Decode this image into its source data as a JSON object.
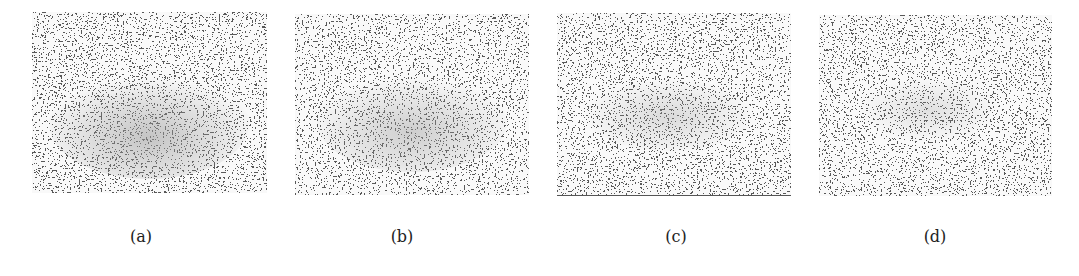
{
  "figure": {
    "panels": [
      {
        "id": "a",
        "label": "(a)",
        "pattern_strength": 0.55,
        "seed": 3
      },
      {
        "id": "b",
        "label": "(b)",
        "pattern_strength": 0.45,
        "seed": 7
      },
      {
        "id": "c",
        "label": "(c)",
        "pattern_strength": 0.32,
        "seed": 11
      },
      {
        "id": "d",
        "label": "(d)",
        "pattern_strength": 0.22,
        "seed": 17
      }
    ],
    "colors": {
      "background": "#ffffff",
      "speckle_dark": "#1a1a1a",
      "speckle_light": "#f2f2f2",
      "pattern_grey": "#9a9a9a",
      "caption_text": "#222222"
    }
  }
}
